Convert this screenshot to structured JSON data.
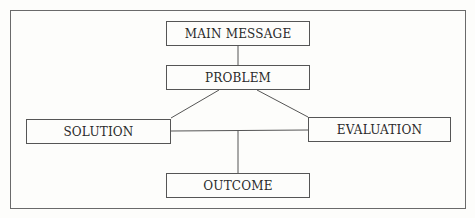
{
  "diagram": {
    "type": "flow-diagram",
    "nodes": [
      {
        "id": "main",
        "label": "MAIN MESSAGE"
      },
      {
        "id": "problem",
        "label": "PROBLEM"
      },
      {
        "id": "solution",
        "label": "SOLUTION"
      },
      {
        "id": "evaluation",
        "label": "EVALUATION"
      },
      {
        "id": "outcome",
        "label": "OUTCOME"
      }
    ],
    "edges": [
      {
        "from": "main",
        "to": "problem"
      },
      {
        "from": "problem",
        "to": "solution"
      },
      {
        "from": "problem",
        "to": "evaluation"
      },
      {
        "from": "solution",
        "to": "evaluation"
      },
      {
        "from": "solution-evaluation-link",
        "to": "outcome"
      }
    ],
    "colors": {
      "line": "#555555",
      "background": "#fdfdfb",
      "text": "#2a2a2a"
    }
  }
}
